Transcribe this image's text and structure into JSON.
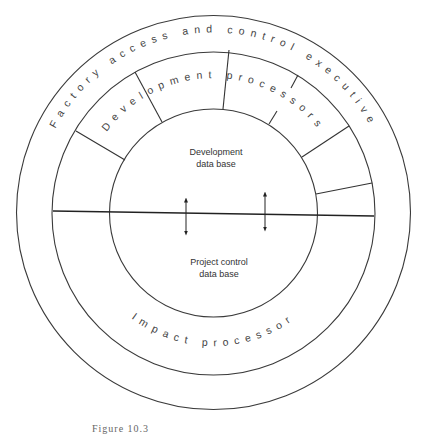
{
  "figure": {
    "outer_ring_label": "Factory access and control executive",
    "development_band_label": "Development processors",
    "impact_band_label": "Impact processor",
    "upper_core": {
      "line1": "Development",
      "line2": "data base"
    },
    "lower_core": {
      "line1": "Project control",
      "line2": "data base"
    },
    "arrows": [
      {
        "name": "bidirectional-arrow-left",
        "direction": "both"
      },
      {
        "name": "bidirectional-arrow-right",
        "direction": "both"
      }
    ],
    "caption": "Figure 10.3"
  }
}
